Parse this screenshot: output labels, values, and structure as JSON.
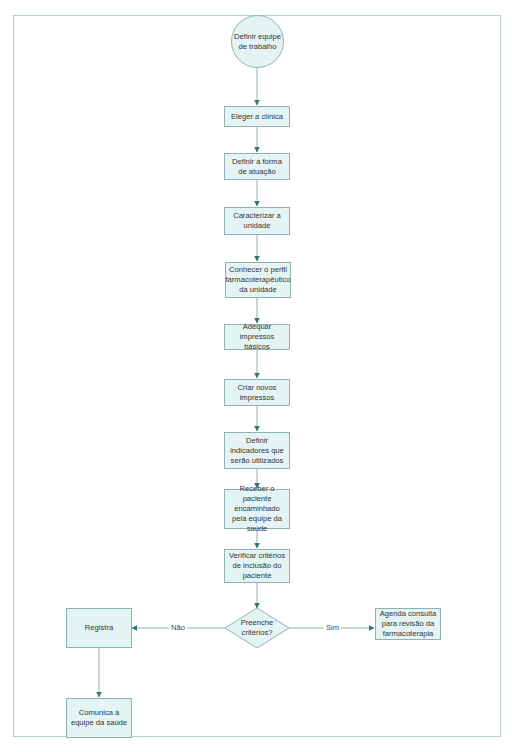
{
  "diagram": {
    "type": "flowchart",
    "colors": {
      "node_fill": "#e4f3f3",
      "node_border": "#8fb3b0",
      "connector": "#8fb3b0",
      "arrowhead": "#2f7a6c",
      "frame": "#b9cfcc"
    },
    "nodes": {
      "start": "Definir equipe de trabalho",
      "n1": "Eleger a clínica",
      "n2": "Definir a forma de atuação",
      "n3": "Caracterizar a unidade",
      "n4": "Conhecer o perfil farmacoterapêutico da unidade",
      "n5": "Adequar impressos básicos",
      "n6": "Criar novos impressos",
      "n7": "Definir indicadores que serão utilizados",
      "n8": "Receber o paciente encaminhado pela equipe da saúde",
      "n9": "Verificar critérios de inclusão do paciente",
      "decision": "Preenche critérios?",
      "no_branch": "Registra",
      "no_branch_2": "Comunica a equipe da saúde",
      "yes_branch": "Agenda consulta para revisão da farmacoterapia"
    },
    "edge_labels": {
      "no": "Não",
      "yes": "Sim"
    }
  }
}
